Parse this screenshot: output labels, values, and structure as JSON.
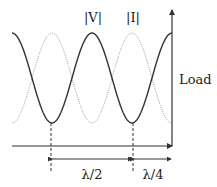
{
  "diagram": {
    "curves": [
      {
        "name": "voltage-magnitude",
        "label": "|V|",
        "style": "solid",
        "color": "#333333",
        "phase": "max at load"
      },
      {
        "name": "current-magnitude",
        "label": "|I|",
        "style": "dotted",
        "color": "#999999",
        "phase": "min at load"
      }
    ],
    "load_label": "Load",
    "dimensions": [
      {
        "label": "λ/2",
        "from": "V minimum",
        "to": "next V minimum"
      },
      {
        "label": "λ/4",
        "from": "V minimum",
        "to": "load"
      }
    ],
    "cycles_shown": 2
  }
}
